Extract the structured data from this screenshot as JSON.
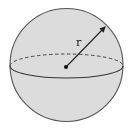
{
  "diagram": {
    "type": "sphere",
    "labels": {
      "radius": "r"
    },
    "colors": {
      "fill": "#dcdcdc",
      "stroke": "#555555",
      "background": "#ffffff"
    }
  }
}
